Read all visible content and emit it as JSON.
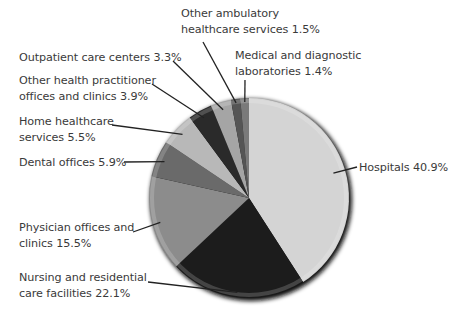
{
  "chart_data": {
    "type": "pie",
    "title": "",
    "start_angle_deg": 0,
    "direction": "clockwise",
    "slices": [
      {
        "label": "Hospitals",
        "value": 40.9,
        "color": "#d4d4d4"
      },
      {
        "label": "Nursing and residential care facilities",
        "value": 22.1,
        "color": "#1c1c1c"
      },
      {
        "label": "Physician offices and clinics",
        "value": 15.5,
        "color": "#8c8c8c"
      },
      {
        "label": "Dental offices",
        "value": 5.9,
        "color": "#6a6a6a"
      },
      {
        "label": "Home healthcare services",
        "value": 5.5,
        "color": "#b8b8b8"
      },
      {
        "label": "Other health practitioner offices and clinics",
        "value": 3.9,
        "color": "#2a2a2a"
      },
      {
        "label": "Outpatient care centers",
        "value": 3.3,
        "color": "#a5a5a5"
      },
      {
        "label": "Other ambulatory healthcare services",
        "value": 1.5,
        "color": "#555555"
      },
      {
        "label": "Medical and diagnostic laboratories",
        "value": 1.4,
        "color": "#7a7a7a"
      }
    ],
    "units": "%"
  },
  "labels": [
    {
      "lines": [
        "Other ambulatory",
        "healthcare services 1.5%"
      ]
    },
    {
      "lines": [
        "Medical and diagnostic",
        "laboratories 1.4%"
      ]
    },
    {
      "lines": [
        "Outpatient care centers 3.3%"
      ]
    },
    {
      "lines": [
        "Other health practitioner",
        "offices and clinics 3.9%"
      ]
    },
    {
      "lines": [
        "Home healthcare",
        "services 5.5%"
      ]
    },
    {
      "lines": [
        "Dental offices 5.9%"
      ]
    },
    {
      "lines": [
        "Physician offices and",
        "clinics 15.5%"
      ]
    },
    {
      "lines": [
        "Nursing and residential",
        "care facilities 22.1%"
      ]
    },
    {
      "lines": [
        "Hospitals 40.9%"
      ]
    }
  ]
}
